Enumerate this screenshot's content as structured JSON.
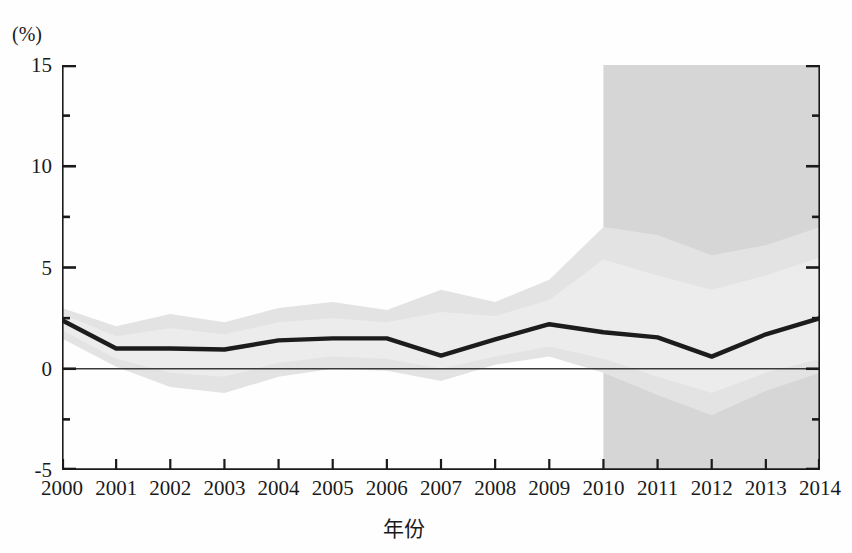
{
  "figure": {
    "unit_label": "(%)",
    "x_axis_title": "年份"
  },
  "axes": {
    "y_ticks_major": [
      "15",
      "10",
      "5",
      "0",
      "-5"
    ],
    "y_major_values": [
      15,
      10,
      5,
      0,
      -5
    ],
    "y_minor_values": [
      12.5,
      7.5,
      2.5,
      -2.5
    ],
    "x_ticks": [
      "2000",
      "2001",
      "2002",
      "2003",
      "2004",
      "2005",
      "2006",
      "2007",
      "2008",
      "2009",
      "2010",
      "2011",
      "2012",
      "2013",
      "2014"
    ]
  },
  "colors": {
    "line": "#1c1c1c",
    "band_outer": "#e3e3e3",
    "band_inner": "#ececec",
    "forecast_region": "#d6d6d6",
    "axis": "#1a1a1a",
    "zero_line": "#3a3a3a",
    "background": "#fefefe"
  },
  "chart_data": {
    "type": "line",
    "title": "",
    "subtitle": "",
    "xlabel": "年份",
    "ylabel": "(%)",
    "ylim": [
      -5,
      15
    ],
    "xlim": [
      2000,
      2014
    ],
    "grid": false,
    "legend": "none",
    "y_unit": "%",
    "x": [
      2000,
      2001,
      2002,
      2003,
      2004,
      2005,
      2006,
      2007,
      2008,
      2009,
      2010,
      2011,
      2012,
      2013,
      2014
    ],
    "series": [
      {
        "name": "中心估计值",
        "kind": "line",
        "values": [
          2.4,
          1.0,
          1.0,
          0.95,
          1.4,
          1.5,
          1.5,
          0.65,
          1.45,
          2.2,
          1.8,
          1.55,
          0.6,
          1.7,
          2.5
        ]
      },
      {
        "name": "置信区间上界",
        "kind": "band_upper",
        "values": [
          3.0,
          2.1,
          2.7,
          2.3,
          3.0,
          3.3,
          2.9,
          3.9,
          3.3,
          4.4,
          7.0,
          6.6,
          5.6,
          6.1,
          7.0
        ]
      },
      {
        "name": "置信区间下界",
        "kind": "band_lower",
        "values": [
          1.5,
          0.1,
          -0.9,
          -1.2,
          -0.4,
          0.0,
          -0.1,
          -0.6,
          0.2,
          0.6,
          -0.2,
          -1.3,
          -2.3,
          -1.1,
          -0.2
        ]
      },
      {
        "name": "内层区间上界",
        "kind": "inner_upper",
        "values": [
          2.7,
          1.6,
          2.0,
          1.7,
          2.3,
          2.5,
          2.3,
          2.8,
          2.6,
          3.4,
          5.4,
          4.6,
          3.9,
          4.6,
          5.5
        ]
      },
      {
        "name": "内层区间下界",
        "kind": "inner_lower",
        "values": [
          1.9,
          0.5,
          -0.2,
          -0.4,
          0.3,
          0.6,
          0.5,
          0.0,
          0.6,
          1.1,
          0.5,
          -0.4,
          -1.2,
          -0.2,
          0.5
        ]
      }
    ],
    "annotations": [
      {
        "name": "forecast-region",
        "type": "shaded-rectangle",
        "x_start": 2010,
        "x_end": 2014,
        "y_start": -5,
        "y_end": 15
      }
    ]
  }
}
